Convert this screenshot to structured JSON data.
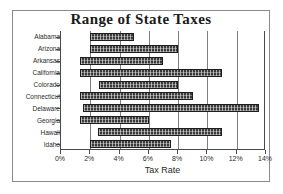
{
  "chart_data": {
    "type": "bar",
    "orientation": "horizontal",
    "subtype": "floating-range-bar",
    "title": "Range of State Taxes",
    "xlabel": "Tax Rate",
    "ylabel": "",
    "xlim": [
      0,
      14
    ],
    "xticks": [
      0,
      2,
      4,
      6,
      8,
      10,
      12,
      14
    ],
    "xticklabels": [
      "0%",
      "2%",
      "4%",
      "6%",
      "8%",
      "10%",
      "12%",
      "14%"
    ],
    "grid": "vertical",
    "legend": "none",
    "bar_color": "#3a3a3a",
    "categories": [
      "Alabama",
      "Arizona",
      "Arkansas",
      "California",
      "Colorado",
      "Connecticut",
      "Delaware",
      "Georgia",
      "Hawaii",
      "Idaho"
    ],
    "series": [
      {
        "name": "Low Rate",
        "values": [
          2.0,
          2.0,
          1.3,
          1.3,
          2.6,
          1.3,
          1.5,
          1.3,
          2.5,
          2.0
        ]
      },
      {
        "name": "High Rate",
        "values": [
          5.0,
          8.0,
          7.0,
          11.0,
          8.0,
          9.0,
          13.5,
          6.0,
          11.0,
          7.5
        ]
      }
    ],
    "bars": [
      {
        "category": "Alabama",
        "start": 2.0,
        "end": 5.0
      },
      {
        "category": "Arizona",
        "start": 2.0,
        "end": 8.0
      },
      {
        "category": "Arkansas",
        "start": 1.3,
        "end": 7.0
      },
      {
        "category": "California",
        "start": 1.3,
        "end": 11.0
      },
      {
        "category": "Colorado",
        "start": 2.6,
        "end": 8.0
      },
      {
        "category": "Connecticut",
        "start": 1.3,
        "end": 9.0
      },
      {
        "category": "Delaware",
        "start": 1.5,
        "end": 13.5
      },
      {
        "category": "Georgia",
        "start": 1.3,
        "end": 6.0
      },
      {
        "category": "Hawaii",
        "start": 2.5,
        "end": 11.0
      },
      {
        "category": "Idaho",
        "start": 2.0,
        "end": 7.5
      }
    ]
  }
}
